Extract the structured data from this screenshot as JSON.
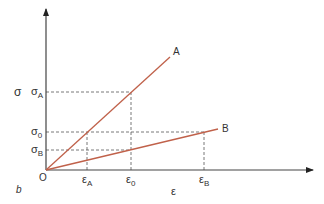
{
  "diagram": {
    "panel_label": "b",
    "y_axis_label": "σ",
    "x_axis_label": "ε",
    "origin_label": "O",
    "colors": {
      "axis": "#444444",
      "line": "#c0614a",
      "dashed": "#555555",
      "text": "#333333"
    },
    "lines": [
      {
        "name": "A",
        "label": "A"
      },
      {
        "name": "B",
        "label": "B"
      }
    ],
    "y_ticks": [
      {
        "sym": "σ",
        "sub": "A"
      },
      {
        "sym": "σ",
        "sub": "0"
      },
      {
        "sym": "σ",
        "sub": "B"
      }
    ],
    "x_ticks": [
      {
        "sym": "ε",
        "sub": "A"
      },
      {
        "sym": "ε",
        "sub": "0"
      },
      {
        "sym": "ε",
        "sub": "B"
      }
    ]
  }
}
